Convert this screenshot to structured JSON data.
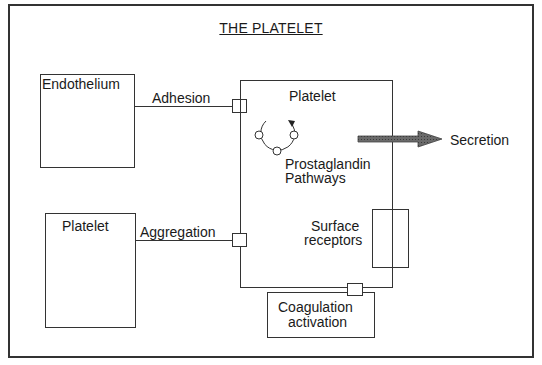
{
  "title": "THE PLATELET",
  "nodes": {
    "endothelium": {
      "label": "Endothelium"
    },
    "platelet_main": {
      "label": "Platelet"
    },
    "platelet_left": {
      "label": "Platelet"
    },
    "prostaglandin": {
      "line1": "Prostaglandin",
      "line2": "Pathways"
    },
    "surface_receptors": {
      "line1": "Surface",
      "line2": "receptors"
    },
    "coagulation": {
      "line1": "Coagulation",
      "line2": "activation"
    },
    "secretion": {
      "label": "Secretion"
    }
  },
  "edges": {
    "adhesion": {
      "label": "Adhesion",
      "from": "Endothelium",
      "to": "Platelet"
    },
    "aggregation": {
      "label": "Aggregation",
      "from": "Platelet",
      "to": "Platelet"
    },
    "secretion_arrow": {
      "from": "Platelet",
      "to": "Secretion"
    }
  },
  "colors": {
    "stroke": "#333333",
    "arrow_fill": "#555555",
    "background": "#ffffff"
  }
}
